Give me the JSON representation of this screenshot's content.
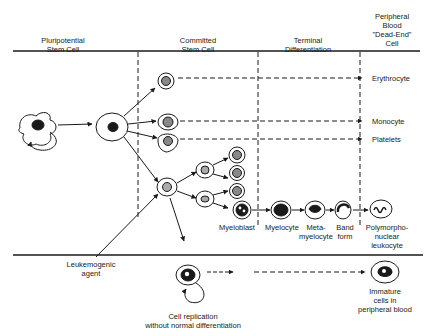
{
  "headers": {
    "col1": [
      "Pluripotential",
      "Stem Cell"
    ],
    "col2": [
      "Committed",
      "Stem Cell"
    ],
    "col3": [
      "Terminal",
      "Differentiation"
    ],
    "col4": [
      "Peripheral",
      "Blood",
      "\"Dead-End\"",
      "Cell"
    ]
  },
  "end_cells": {
    "erythrocyte": "Erythrocyte",
    "monocyte": "Monocyte",
    "platelets": "Platelets"
  },
  "granulocyte_series": {
    "myeloblast": "Myeloblast",
    "myelocyte": "Myelocyte",
    "metamyelocyte": [
      "Meta-",
      "myelocyte"
    ],
    "band_form": [
      "Band",
      "form"
    ],
    "pmn": [
      "Polymorpho-",
      "nuclear",
      "leukocyte"
    ]
  },
  "leukemia": {
    "agent": [
      "Leukemogenic",
      "agent"
    ],
    "replication": [
      "Cell replication",
      "without normal differentiation"
    ],
    "immature": [
      "Immature",
      "cells in",
      "peripheral blood"
    ]
  },
  "colors": {
    "ink": "#1a1a1a",
    "background": "#ffffff"
  }
}
